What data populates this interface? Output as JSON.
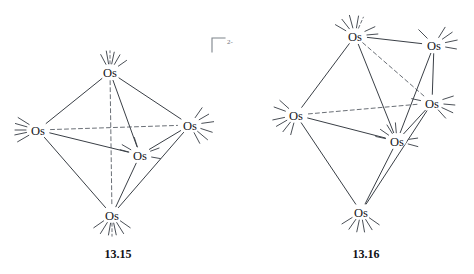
{
  "figure": {
    "background_color": "#ffffff",
    "bond_color": "#3a3f46",
    "hidden_bond_color": "#6a6f76",
    "label_color": "#15181c"
  },
  "structures": [
    {
      "id": "structure-13-15",
      "caption": "13.15",
      "caption_pos": {
        "x": 118,
        "y": 258
      },
      "formula_hint": "Os5",
      "charge": {
        "text": "2-",
        "bracket": true,
        "pos": {
          "x": 212,
          "y": 38
        }
      },
      "atoms": [
        {
          "name": "os-top",
          "label": "Os",
          "x": 110,
          "y": 72
        },
        {
          "name": "os-left",
          "label": "Os",
          "x": 38,
          "y": 130
        },
        {
          "name": "os-right",
          "label": "Os",
          "x": 190,
          "y": 125
        },
        {
          "name": "os-center",
          "label": "Os",
          "x": 140,
          "y": 155
        },
        {
          "name": "os-bottom",
          "label": "Os",
          "x": 112,
          "y": 215
        }
      ],
      "bonds_solid": [
        [
          "os-top",
          "os-left"
        ],
        [
          "os-top",
          "os-right"
        ],
        [
          "os-top",
          "os-center"
        ],
        [
          "os-left",
          "os-center"
        ],
        [
          "os-left",
          "os-bottom"
        ],
        [
          "os-right",
          "os-center"
        ],
        [
          "os-right",
          "os-bottom"
        ],
        [
          "os-center",
          "os-bottom"
        ]
      ],
      "bonds_dashed": [
        [
          "os-top",
          "os-bottom"
        ],
        [
          "os-left",
          "os-right"
        ]
      ]
    },
    {
      "id": "structure-13-16",
      "caption": "13.16",
      "caption_pos": {
        "x": 366,
        "y": 258
      },
      "formula_hint": "Os6",
      "charge": null,
      "atoms": [
        {
          "name": "os-top-left",
          "label": "Os",
          "x": 355,
          "y": 36
        },
        {
          "name": "os-top-right",
          "label": "Os",
          "x": 434,
          "y": 45
        },
        {
          "name": "os-left",
          "label": "Os",
          "x": 296,
          "y": 115
        },
        {
          "name": "os-right",
          "label": "Os",
          "x": 432,
          "y": 103
        },
        {
          "name": "os-center",
          "label": "Os",
          "x": 397,
          "y": 141
        },
        {
          "name": "os-bottom",
          "label": "Os",
          "x": 361,
          "y": 212
        }
      ],
      "bonds_solid": [
        [
          "os-top-left",
          "os-top-right"
        ],
        [
          "os-top-left",
          "os-left"
        ],
        [
          "os-top-left",
          "os-center"
        ],
        [
          "os-top-right",
          "os-right"
        ],
        [
          "os-top-right",
          "os-center"
        ],
        [
          "os-left",
          "os-center"
        ],
        [
          "os-left",
          "os-bottom"
        ],
        [
          "os-right",
          "os-center"
        ],
        [
          "os-right",
          "os-bottom"
        ],
        [
          "os-center",
          "os-bottom"
        ]
      ],
      "bonds_dashed": [
        [
          "os-top-left",
          "os-right"
        ],
        [
          "os-left",
          "os-right"
        ]
      ]
    }
  ]
}
